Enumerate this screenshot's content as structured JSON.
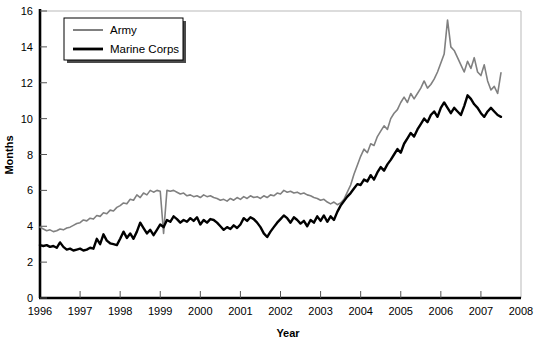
{
  "chart_data": {
    "type": "line",
    "title": "",
    "xlabel": "Year",
    "ylabel": "Months",
    "xlim": [
      1996,
      2008
    ],
    "ylim": [
      0,
      16
    ],
    "xticks": [
      "1996",
      "1997",
      "1998",
      "1999",
      "2000",
      "2001",
      "2002",
      "2003",
      "2004",
      "2005",
      "2006",
      "2007",
      "2008"
    ],
    "yticks": [
      "0",
      "2",
      "4",
      "6",
      "8",
      "10",
      "12",
      "14",
      "16"
    ],
    "grid": false,
    "legend_position": "top-left",
    "series": [
      {
        "name": "Army",
        "color": "#808080",
        "x": [
          1996.0,
          1996.083,
          1996.167,
          1996.25,
          1996.333,
          1996.417,
          1996.5,
          1996.583,
          1996.667,
          1996.75,
          1996.833,
          1996.917,
          1997.0,
          1997.083,
          1997.167,
          1997.25,
          1997.333,
          1997.417,
          1997.5,
          1997.583,
          1997.667,
          1997.75,
          1997.833,
          1997.917,
          1998.0,
          1998.083,
          1998.167,
          1998.25,
          1998.333,
          1998.417,
          1998.5,
          1998.583,
          1998.667,
          1998.75,
          1998.833,
          1998.917,
          1999.0,
          1999.083,
          1999.167,
          1999.25,
          1999.333,
          1999.417,
          1999.5,
          1999.583,
          1999.667,
          1999.75,
          1999.833,
          1999.917,
          2000.0,
          2000.083,
          2000.167,
          2000.25,
          2000.333,
          2000.417,
          2000.5,
          2000.583,
          2000.667,
          2000.75,
          2000.833,
          2000.917,
          2001.0,
          2001.083,
          2001.167,
          2001.25,
          2001.333,
          2001.417,
          2001.5,
          2001.583,
          2001.667,
          2001.75,
          2001.833,
          2001.917,
          2002.0,
          2002.083,
          2002.167,
          2002.25,
          2002.333,
          2002.417,
          2002.5,
          2002.583,
          2002.667,
          2002.75,
          2002.833,
          2002.917,
          2003.0,
          2003.083,
          2003.167,
          2003.25,
          2003.333,
          2003.417,
          2003.5,
          2003.583,
          2003.667,
          2003.75,
          2003.833,
          2003.917,
          2004.0,
          2004.083,
          2004.167,
          2004.25,
          2004.333,
          2004.417,
          2004.5,
          2004.583,
          2004.667,
          2004.75,
          2004.833,
          2004.917,
          2005.0,
          2005.083,
          2005.167,
          2005.25,
          2005.333,
          2005.417,
          2005.5,
          2005.583,
          2005.667,
          2005.75,
          2005.833,
          2005.917,
          2006.0,
          2006.083,
          2006.167,
          2006.25,
          2006.333,
          2006.417,
          2006.5,
          2006.583,
          2006.667,
          2006.75,
          2006.833,
          2006.917,
          2007.0,
          2007.083,
          2007.167,
          2007.25,
          2007.333,
          2007.417,
          2007.5
        ],
        "values": [
          3.95,
          3.85,
          3.75,
          3.8,
          3.7,
          3.75,
          3.85,
          3.8,
          3.9,
          3.95,
          4.05,
          4.15,
          4.2,
          4.35,
          4.3,
          4.45,
          4.4,
          4.6,
          4.55,
          4.75,
          4.7,
          4.9,
          4.85,
          5.05,
          5.15,
          5.3,
          5.25,
          5.5,
          5.45,
          5.75,
          5.6,
          5.85,
          5.75,
          6.0,
          5.9,
          6.0,
          5.95,
          3.6,
          6.0,
          5.95,
          6.0,
          5.9,
          5.8,
          5.85,
          5.7,
          5.75,
          5.65,
          5.7,
          5.6,
          5.75,
          5.65,
          5.7,
          5.6,
          5.55,
          5.45,
          5.5,
          5.4,
          5.55,
          5.45,
          5.6,
          5.5,
          5.65,
          5.55,
          5.7,
          5.6,
          5.65,
          5.55,
          5.7,
          5.6,
          5.75,
          5.7,
          5.85,
          5.8,
          6.0,
          5.9,
          5.95,
          5.85,
          5.9,
          5.8,
          5.85,
          5.75,
          5.7,
          5.6,
          5.55,
          5.45,
          5.5,
          5.35,
          5.25,
          5.35,
          5.2,
          5.3,
          5.5,
          5.9,
          6.3,
          6.9,
          7.4,
          7.9,
          8.3,
          8.1,
          8.6,
          8.5,
          9.0,
          9.3,
          9.6,
          9.4,
          10.0,
          10.3,
          10.5,
          10.9,
          11.2,
          10.9,
          11.4,
          11.1,
          11.4,
          11.7,
          12.1,
          11.7,
          11.9,
          12.2,
          12.6,
          13.1,
          13.6,
          15.5,
          14.0,
          13.8,
          13.4,
          13.0,
          12.6,
          13.2,
          12.8,
          13.4,
          12.6,
          12.4,
          13.0,
          12.1,
          11.6,
          11.8,
          11.4,
          12.55
        ]
      },
      {
        "name": "Marine Corps",
        "color": "#000000",
        "x": [
          1996.0,
          1996.083,
          1996.167,
          1996.25,
          1996.333,
          1996.417,
          1996.5,
          1996.583,
          1996.667,
          1996.75,
          1996.833,
          1996.917,
          1997.0,
          1997.083,
          1997.167,
          1997.25,
          1997.333,
          1997.417,
          1997.5,
          1997.583,
          1997.667,
          1997.75,
          1997.833,
          1997.917,
          1998.0,
          1998.083,
          1998.167,
          1998.25,
          1998.333,
          1998.417,
          1998.5,
          1998.583,
          1998.667,
          1998.75,
          1998.833,
          1998.917,
          1999.0,
          1999.083,
          1999.167,
          1999.25,
          1999.333,
          1999.417,
          1999.5,
          1999.583,
          1999.667,
          1999.75,
          1999.833,
          1999.917,
          2000.0,
          2000.083,
          2000.167,
          2000.25,
          2000.333,
          2000.417,
          2000.5,
          2000.583,
          2000.667,
          2000.75,
          2000.833,
          2000.917,
          2001.0,
          2001.083,
          2001.167,
          2001.25,
          2001.333,
          2001.417,
          2001.5,
          2001.583,
          2001.667,
          2001.75,
          2001.833,
          2001.917,
          2002.0,
          2002.083,
          2002.167,
          2002.25,
          2002.333,
          2002.417,
          2002.5,
          2002.583,
          2002.667,
          2002.75,
          2002.833,
          2002.917,
          2003.0,
          2003.083,
          2003.167,
          2003.25,
          2003.333,
          2003.417,
          2003.5,
          2003.583,
          2003.667,
          2003.75,
          2003.833,
          2003.917,
          2004.0,
          2004.083,
          2004.167,
          2004.25,
          2004.333,
          2004.417,
          2004.5,
          2004.583,
          2004.667,
          2004.75,
          2004.833,
          2004.917,
          2005.0,
          2005.083,
          2005.167,
          2005.25,
          2005.333,
          2005.417,
          2005.5,
          2005.583,
          2005.667,
          2005.75,
          2005.833,
          2005.917,
          2006.0,
          2006.083,
          2006.167,
          2006.25,
          2006.333,
          2006.417,
          2006.5,
          2006.583,
          2006.667,
          2006.75,
          2006.833,
          2006.917,
          2007.0,
          2007.083,
          2007.167,
          2007.25,
          2007.333,
          2007.417,
          2007.5
        ],
        "values": [
          2.95,
          2.9,
          2.95,
          2.85,
          2.9,
          2.8,
          3.1,
          2.85,
          2.7,
          2.75,
          2.65,
          2.7,
          2.75,
          2.65,
          2.7,
          2.8,
          2.75,
          3.3,
          3.0,
          3.55,
          3.2,
          3.05,
          3.0,
          2.95,
          3.3,
          3.7,
          3.35,
          3.6,
          3.3,
          3.7,
          4.2,
          3.9,
          3.6,
          3.8,
          3.5,
          3.8,
          4.1,
          3.95,
          4.35,
          4.25,
          4.55,
          4.4,
          4.2,
          4.35,
          4.25,
          4.45,
          4.3,
          4.5,
          4.1,
          4.35,
          4.2,
          4.4,
          4.35,
          4.2,
          4.0,
          3.8,
          3.95,
          3.85,
          4.05,
          3.9,
          4.1,
          4.45,
          4.3,
          4.5,
          4.4,
          4.2,
          3.95,
          3.6,
          3.4,
          3.7,
          3.95,
          4.2,
          4.4,
          4.6,
          4.45,
          4.2,
          4.5,
          4.35,
          4.15,
          4.3,
          4.0,
          4.35,
          4.2,
          4.55,
          4.3,
          4.6,
          4.25,
          4.55,
          4.35,
          4.8,
          5.15,
          5.4,
          5.65,
          5.85,
          6.1,
          6.35,
          6.3,
          6.6,
          6.5,
          6.85,
          6.6,
          7.0,
          7.3,
          7.1,
          7.45,
          7.7,
          8.0,
          8.3,
          8.1,
          8.6,
          8.9,
          9.2,
          9.0,
          9.4,
          9.7,
          10.0,
          9.8,
          10.2,
          10.4,
          10.1,
          10.6,
          10.9,
          10.6,
          10.3,
          10.6,
          10.4,
          10.2,
          10.7,
          11.3,
          11.1,
          10.8,
          10.6,
          10.3,
          10.1,
          10.4,
          10.6,
          10.4,
          10.2,
          10.1
        ]
      }
    ]
  },
  "legend": {
    "entries": [
      {
        "label": "Army"
      },
      {
        "label": "Marine Corps"
      }
    ]
  }
}
